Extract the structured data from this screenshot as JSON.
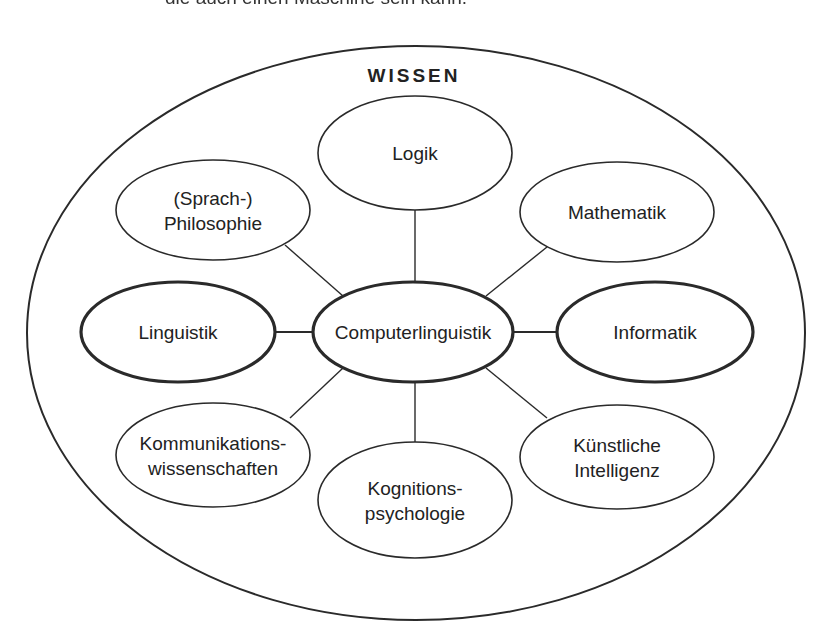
{
  "top_text": "die auch einen Maschine sein kann.",
  "diagram": {
    "title": "WISSEN",
    "center": {
      "id": "computerlinguistik",
      "lines": [
        "Computerlinguistik"
      ],
      "cx": 413,
      "cy": 332,
      "rx": 100,
      "ry": 50,
      "bold": true
    },
    "nodes": [
      {
        "id": "logik",
        "lines": [
          "Logik"
        ],
        "cx": 415,
        "cy": 153,
        "rx": 97,
        "ry": 57,
        "bold": false,
        "link": [
          415,
          96,
          415,
          282
        ]
      },
      {
        "id": "philosophie",
        "lines": [
          "(Sprach-)",
          "Philosophie"
        ],
        "cx": 213,
        "cy": 210,
        "rx": 97,
        "ry": 50,
        "bold": false,
        "link": [
          285,
          245,
          343,
          296
        ]
      },
      {
        "id": "mathematik",
        "lines": [
          "Mathematik"
        ],
        "cx": 617,
        "cy": 212,
        "rx": 97,
        "ry": 50,
        "bold": false,
        "link": [
          547,
          247,
          486,
          296
        ]
      },
      {
        "id": "linguistik",
        "lines": [
          "Linguistik"
        ],
        "cx": 178,
        "cy": 332,
        "rx": 97,
        "ry": 50,
        "bold": true,
        "link": [
          275,
          332,
          313,
          332
        ]
      },
      {
        "id": "informatik",
        "lines": [
          "Informatik"
        ],
        "cx": 655,
        "cy": 332,
        "rx": 98,
        "ry": 50,
        "bold": true,
        "link": [
          513,
          332,
          557,
          332
        ]
      },
      {
        "id": "kommunikationswissenschaften",
        "lines": [
          "Kommunikations-",
          "wissenschaften"
        ],
        "cx": 213,
        "cy": 455,
        "rx": 97,
        "ry": 52,
        "bold": false,
        "link": [
          290,
          418,
          343,
          368
        ]
      },
      {
        "id": "kognitionspsychologie",
        "lines": [
          "Kognitions-",
          "psychologie"
        ],
        "cx": 415,
        "cy": 500,
        "rx": 97,
        "ry": 58,
        "bold": false,
        "link": [
          415,
          382,
          415,
          442
        ]
      },
      {
        "id": "kuenstliche-intelligenz",
        "lines": [
          "Künstliche",
          "Intelligenz"
        ],
        "cx": 617,
        "cy": 457,
        "rx": 97,
        "ry": 52,
        "bold": false,
        "link": [
          547,
          418,
          486,
          368
        ]
      }
    ],
    "outer": {
      "cx": 416,
      "cy": 333,
      "rx": 389,
      "ry": 287
    },
    "colors": {
      "stroke": "#2a2a2a",
      "text": "#222222",
      "background": "#ffffff"
    }
  }
}
